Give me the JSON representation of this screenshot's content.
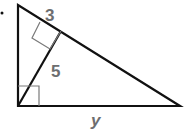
{
  "diagram": {
    "type": "right-triangle-with-altitude",
    "labels": {
      "segment_hyp_top": "3",
      "altitude": "5",
      "base": "y"
    },
    "colors": {
      "stroke": "#111111",
      "label": "#6d6e70",
      "right_angle_marker": "#7a7a7a"
    }
  }
}
